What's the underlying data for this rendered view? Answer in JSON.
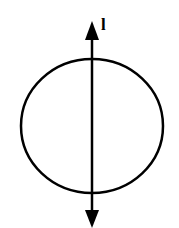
{
  "diagram": {
    "axis_label": "l",
    "stroke_color": "#000000",
    "background": "#ffffff",
    "elements": [
      "circle",
      "vertical double-headed axis line through circle center"
    ]
  }
}
